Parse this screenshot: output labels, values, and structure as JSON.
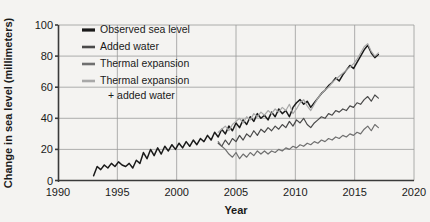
{
  "chart_data": {
    "type": "line",
    "title": "",
    "xlabel": "Year",
    "ylabel": "Change in sea level (millimeters)",
    "xlim": [
      1990,
      2020
    ],
    "ylim": [
      0,
      100
    ],
    "xticks": [
      1990,
      1995,
      2000,
      2005,
      2010,
      2015,
      2020
    ],
    "yticks": [
      0,
      20,
      40,
      60,
      80,
      100
    ],
    "grid": true,
    "legend_position": "top-left",
    "series": [
      {
        "name": "Observed sea level",
        "color": "#1a1a1a",
        "x": [
          1993.0,
          1993.3,
          1993.6,
          1993.9,
          1994.2,
          1994.5,
          1994.8,
          1995.1,
          1995.4,
          1995.7,
          1996.0,
          1996.3,
          1996.6,
          1996.9,
          1997.2,
          1997.5,
          1997.8,
          1998.1,
          1998.4,
          1998.7,
          1999.0,
          1999.3,
          1999.6,
          1999.9,
          2000.2,
          2000.5,
          2000.8,
          2001.1,
          2001.4,
          2001.7,
          2002.0,
          2002.3,
          2002.6,
          2002.9,
          2003.2,
          2003.5,
          2003.8,
          2004.1,
          2004.4,
          2004.7,
          2005.0,
          2005.3,
          2005.6,
          2005.9,
          2006.2,
          2006.5,
          2006.8,
          2007.1,
          2007.4,
          2007.7,
          2008.0,
          2008.3,
          2008.6,
          2008.9,
          2009.2,
          2009.5,
          2009.8,
          2010.1,
          2010.4,
          2010.7,
          2011.0,
          2011.3,
          2011.6,
          2011.9,
          2012.2,
          2012.5,
          2012.8,
          2013.1,
          2013.4,
          2013.7,
          2014.0,
          2014.3,
          2014.6,
          2014.9,
          2015.2,
          2015.5,
          2015.8,
          2016.1,
          2016.4,
          2016.7,
          2017.0
        ],
        "y": [
          3,
          9,
          7,
          10,
          8,
          11,
          9,
          12,
          10,
          9,
          11,
          8,
          13,
          11,
          18,
          14,
          20,
          16,
          21,
          17,
          22,
          19,
          23,
          20,
          24,
          21,
          25,
          22,
          26,
          23,
          27,
          25,
          29,
          26,
          31,
          28,
          33,
          30,
          35,
          32,
          37,
          34,
          39,
          36,
          41,
          38,
          43,
          40,
          42,
          39,
          44,
          41,
          46,
          43,
          45,
          41,
          47,
          50,
          52,
          49,
          51,
          47,
          50,
          53,
          56,
          58,
          61,
          63,
          66,
          64,
          68,
          71,
          74,
          72,
          76,
          80,
          84,
          87,
          82,
          79,
          81
        ]
      },
      {
        "name": "Added water",
        "color": "#4a4a4a",
        "x": [
          2003.5,
          2003.8,
          2004.1,
          2004.4,
          2004.7,
          2005.0,
          2005.3,
          2005.6,
          2005.9,
          2006.2,
          2006.5,
          2006.8,
          2007.1,
          2007.4,
          2007.7,
          2008.0,
          2008.3,
          2008.6,
          2008.9,
          2009.2,
          2009.5,
          2009.8,
          2010.1,
          2010.4,
          2010.7,
          2011.0,
          2011.3,
          2011.6,
          2011.9,
          2012.2,
          2012.5,
          2012.8,
          2013.1,
          2013.4,
          2013.7,
          2014.0,
          2014.3,
          2014.6,
          2014.9,
          2015.2,
          2015.5,
          2015.8,
          2016.1,
          2016.4,
          2016.7,
          2017.0
        ],
        "y": [
          24,
          22,
          26,
          23,
          27,
          25,
          29,
          26,
          30,
          28,
          32,
          29,
          33,
          31,
          34,
          32,
          35,
          33,
          36,
          34,
          38,
          35,
          39,
          37,
          40,
          36,
          34,
          37,
          39,
          41,
          40,
          43,
          42,
          45,
          44,
          46,
          45,
          48,
          47,
          50,
          49,
          52,
          54,
          51,
          55,
          53
        ]
      },
      {
        "name": "Thermal expansion",
        "color": "#6f6f6f",
        "x": [
          2003.5,
          2003.8,
          2004.1,
          2004.4,
          2004.7,
          2005.0,
          2005.3,
          2005.6,
          2005.9,
          2006.2,
          2006.5,
          2006.8,
          2007.1,
          2007.4,
          2007.7,
          2008.0,
          2008.3,
          2008.6,
          2008.9,
          2009.2,
          2009.5,
          2009.8,
          2010.1,
          2010.4,
          2010.7,
          2011.0,
          2011.3,
          2011.6,
          2011.9,
          2012.2,
          2012.5,
          2012.8,
          2013.1,
          2013.4,
          2013.7,
          2014.0,
          2014.3,
          2014.6,
          2014.9,
          2015.2,
          2015.5,
          2015.8,
          2016.1,
          2016.4,
          2016.7,
          2017.0
        ],
        "y": [
          25,
          22,
          20,
          17,
          15,
          18,
          14,
          17,
          15,
          18,
          16,
          19,
          17,
          19,
          17,
          19,
          18,
          20,
          19,
          21,
          20,
          22,
          21,
          23,
          22,
          24,
          23,
          25,
          24,
          26,
          25,
          27,
          26,
          28,
          27,
          29,
          28,
          30,
          29,
          31,
          30,
          33,
          35,
          32,
          36,
          34
        ]
      },
      {
        "name": "Thermal expansion + added water",
        "color": "#a8a8a8",
        "x": [
          2003.5,
          2003.8,
          2004.1,
          2004.4,
          2004.7,
          2005.0,
          2005.3,
          2005.6,
          2005.9,
          2006.2,
          2006.5,
          2006.8,
          2007.1,
          2007.4,
          2007.7,
          2008.0,
          2008.3,
          2008.6,
          2008.9,
          2009.2,
          2009.5,
          2009.8,
          2010.1,
          2010.4,
          2010.7,
          2011.0,
          2011.3,
          2011.6,
          2011.9,
          2012.2,
          2012.5,
          2012.8,
          2013.1,
          2013.4,
          2013.7,
          2014.0,
          2014.3,
          2014.6,
          2014.9,
          2015.2,
          2015.5,
          2015.8,
          2016.1,
          2016.4,
          2016.7,
          2017.0
        ],
        "y": [
          31,
          33,
          35,
          32,
          36,
          38,
          40,
          37,
          41,
          39,
          43,
          41,
          44,
          42,
          45,
          43,
          46,
          44,
          47,
          45,
          49,
          43,
          46,
          50,
          52,
          48,
          45,
          49,
          53,
          56,
          58,
          60,
          63,
          65,
          67,
          69,
          71,
          73,
          75,
          78,
          82,
          86,
          88,
          83,
          80,
          82
        ]
      }
    ]
  },
  "legend": {
    "items": [
      {
        "label": "Observed sea level",
        "color": "#1a1a1a"
      },
      {
        "label": "Added water",
        "color": "#4a4a4a"
      },
      {
        "label": "Thermal expansion",
        "color": "#6f6f6f"
      },
      {
        "label": "Thermal expansion",
        "label2": "+ added water",
        "color": "#a8a8a8"
      }
    ]
  },
  "axes": {
    "y_title": "Change in sea level (millimeters)",
    "x_title": "Year",
    "y_ticks": [
      "0",
      "20",
      "40",
      "60",
      "80",
      "100"
    ],
    "x_ticks": [
      "1990",
      "1995",
      "2000",
      "2005",
      "2010",
      "2015",
      "2020"
    ]
  }
}
